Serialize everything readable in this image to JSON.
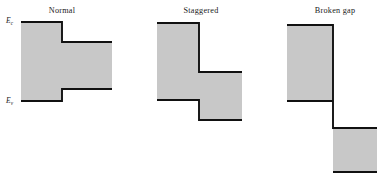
{
  "figure": {
    "background_color": "#ffffff",
    "fill_color": "#c8c8c8",
    "edge_color": "#111111",
    "width": 383,
    "height": 182
  },
  "axis_labels": {
    "conduction": {
      "symbol": "E",
      "subscript": "c",
      "x": 13,
      "y": 23
    },
    "valence": {
      "symbol": "E",
      "subscript": "v",
      "x": 13,
      "y": 103
    }
  },
  "panels": [
    {
      "id": "normal",
      "title": "Normal",
      "title_x": 62,
      "title_y": 13,
      "fill_points": "21,22 62,22 62,42 112,42 112,89 62,89 62,101 21,101",
      "edges": [
        "21,22 62,22 62,42 112,42",
        "21,101 62,101 62,89 112,89"
      ]
    },
    {
      "id": "staggered",
      "title": "Staggered",
      "title_x": 201,
      "title_y": 13,
      "fill_points": "157,23 199,23 199,72 242,72 242,120 199,120 199,100 157,100",
      "edges": [
        "157,23 199,23 199,72 242,72",
        "157,100 199,100 199,120 242,120"
      ]
    },
    {
      "id": "broken-gap",
      "title": "Broken gap",
      "title_x": 335,
      "title_y": 13,
      "fill_points_left": "287,25 333,25 333,101 287,101",
      "fill_points_right": "333,128 377,128 377,172 333,172",
      "edges": [
        "287,25 333,25 333,128 377,128",
        "287,101 333,101",
        "333,172 377,172"
      ]
    }
  ],
  "chart_data": {
    "type": "diagram",
    "title": "",
    "categories": [
      "Normal",
      "Staggered",
      "Broken gap"
    ],
    "band_edges": [
      "E_c",
      "E_v"
    ],
    "series": [
      {
        "name": "Normal",
        "description": "Type I straddling gap: narrow-gap material band edges lie entirely within the wide-gap material band edges",
        "left_Ec": 22,
        "right_Ec": 42,
        "left_Ev": 101,
        "right_Ev": 89,
        "interface_x": 62
      },
      {
        "name": "Staggered",
        "description": "Type II staggered gap: conduction and valence band edges both step down across the interface",
        "left_Ec": 23,
        "right_Ec": 72,
        "left_Ev": 100,
        "right_Ev": 120,
        "interface_x": 199
      },
      {
        "name": "Broken gap",
        "description": "Type III broken gap: right-side conduction band edge lies below the left-side valence band edge",
        "left_Ec": 25,
        "right_Ec": 128,
        "left_Ev": 101,
        "right_Ev": 172,
        "interface_x": 333
      }
    ],
    "xlabel": "",
    "ylabel": "Energy",
    "grid": false,
    "legend": "none",
    "note": "y pixel coordinates increase downward; lower pixel y = higher energy"
  }
}
